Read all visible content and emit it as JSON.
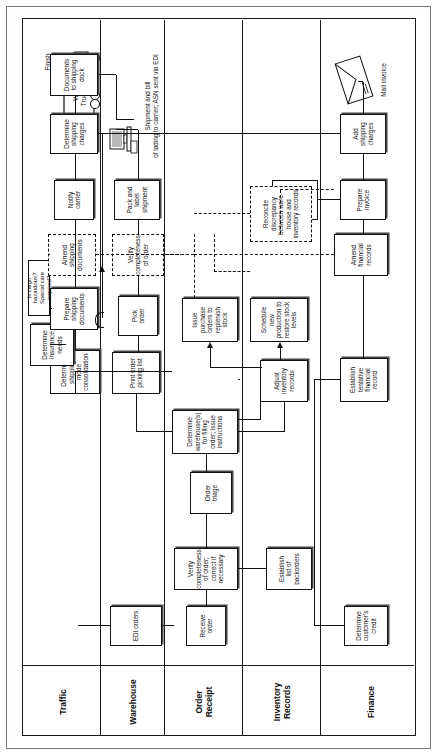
{
  "diagram": {
    "start_label": "Start",
    "finish_label": "Finish",
    "lanes": [
      {
        "id": "traffic",
        "label": "Traffic"
      },
      {
        "id": "warehouse",
        "label": "Warehouse"
      },
      {
        "id": "order",
        "label": "Order\nReceipt"
      },
      {
        "id": "inventory",
        "label": "Inventory\nRecords"
      },
      {
        "id": "finance",
        "label": "Finance"
      }
    ],
    "lane_labels": {
      "traffic": "Traffic",
      "warehouse": "Warehouse",
      "order_line1": "Order",
      "order_line2": "Receipt",
      "inventory_line1": "Inventory",
      "inventory_line2": "Records",
      "finance": "Finance"
    },
    "nodes": {
      "receive_order": {
        "label": "Receive\norder",
        "lane": "order",
        "style": "solid"
      },
      "verify_completeness_order": {
        "label": "Verify completeness\nof order; correct if\nnecessary",
        "lane": "order",
        "style": "solid"
      },
      "edi_orders": {
        "label": "EDI orders",
        "lane": "warehouse",
        "style": "solid"
      },
      "determine_customer_credit": {
        "label": "Determine\ncustomer's\ncredit",
        "lane": "finance",
        "style": "solid"
      },
      "establish_list_backorders": {
        "label": "Establish\nlist of\nbackorders",
        "lane": "inventory",
        "style": "solid"
      },
      "order_triage": {
        "label": "Order\ntriage",
        "lane": "order",
        "style": "solid"
      },
      "determine_warehouses": {
        "label": "Determine\nwarehouse(s) for filling\norder; issue instructions",
        "lane": "order",
        "style": "solid"
      },
      "establish_tentative_financial_record": {
        "label": "Establish\ntentative\nfinancial record",
        "lane": "finance",
        "style": "solid"
      },
      "adjust_inventory_records": {
        "label": "Adjust\ninventory\nrecords",
        "lane": "inventory",
        "style": "solid"
      },
      "schedule_new_production": {
        "label": "Schedule new\nproduction to\nrestore stock levels",
        "lane": "inventory",
        "style": "solid"
      },
      "issue_purchase_orders": {
        "label": "Issue purchase\norders to\nreplenish stock",
        "lane": "inventory",
        "style": "solid"
      },
      "print_order_picking_list": {
        "label": "Print order\npicking list",
        "lane": "warehouse",
        "style": "solid"
      },
      "pick_order": {
        "label": "Pick\norder",
        "lane": "warehouse",
        "style": "solid"
      },
      "verify_completeness_dashed": {
        "label": "Verify\ncompleteness\nof order",
        "lane": "warehouse",
        "style": "dashed"
      },
      "pack_and_label": {
        "label": "Pack and\nlabel\nshipment",
        "lane": "warehouse",
        "style": "solid"
      },
      "determine_shipping_mode": {
        "label": "Determine\nshipping mode\nconsolidation",
        "lane": "traffic",
        "style": "solid"
      },
      "determine_insurance_needs": {
        "label": "Determine\ninsurance\nneeds",
        "lane": "traffic",
        "style": "solid"
      },
      "prepare_shipping_documents": {
        "label": "Prepare\nshipping\ndocuments",
        "lane": "traffic",
        "style": "solid"
      },
      "is_cargo_hazardous": {
        "label": "Is cargo hazardous?\nSpecial care required?",
        "lane": "traffic",
        "style": "solid"
      },
      "amend_shipping_documents": {
        "label": "Amend\nshipping\ndocuments",
        "lane": "traffic",
        "style": "dashed"
      },
      "notify_carrier": {
        "label": "Notify\ncarrier",
        "lane": "traffic",
        "style": "solid"
      },
      "determine_shipping_charges": {
        "label": "Determine\nshipping\ncharges",
        "lane": "traffic",
        "style": "solid"
      },
      "documents_to_shipping_dock": {
        "label": "Documents\nto shipping\ndock",
        "lane": "traffic",
        "style": "solid"
      },
      "reconcile_discrepancy": {
        "label": "Reconcile\ndiscrepancy\nbetween ware-\nhouse and\ninventory records",
        "lane": "inventory",
        "style": "dashed"
      },
      "credit_sales_person": {
        "label": "Credit\nsales\nperson",
        "lane": "finance",
        "style": "solid"
      },
      "prepare_invoice": {
        "label": "Prepare\ninvoice",
        "lane": "finance",
        "style": "solid"
      },
      "amend_financial_records": {
        "label": "Amend\nfinancial\nrecords",
        "lane": "finance",
        "style": "dashed"
      },
      "add_shipping_charges": {
        "label": "Add\nshipping\ncharges",
        "lane": "finance",
        "style": "solid"
      }
    },
    "annotations": {
      "shipment_note_line1": "Shipment and bill",
      "shipment_note_line2": "of lading to carrier; ASN sent via EDI",
      "carrier_name_line1": "W&J",
      "carrier_name_line2": "Trucking",
      "mail_invoice": "Mail invoice"
    },
    "icons": {
      "truck": "truck-icon",
      "computer": "computer-icon",
      "envelope": "envelope-icon"
    },
    "colors": {
      "line": "#111111",
      "page": "#ffffff",
      "frame": "#7a7a7a"
    }
  }
}
